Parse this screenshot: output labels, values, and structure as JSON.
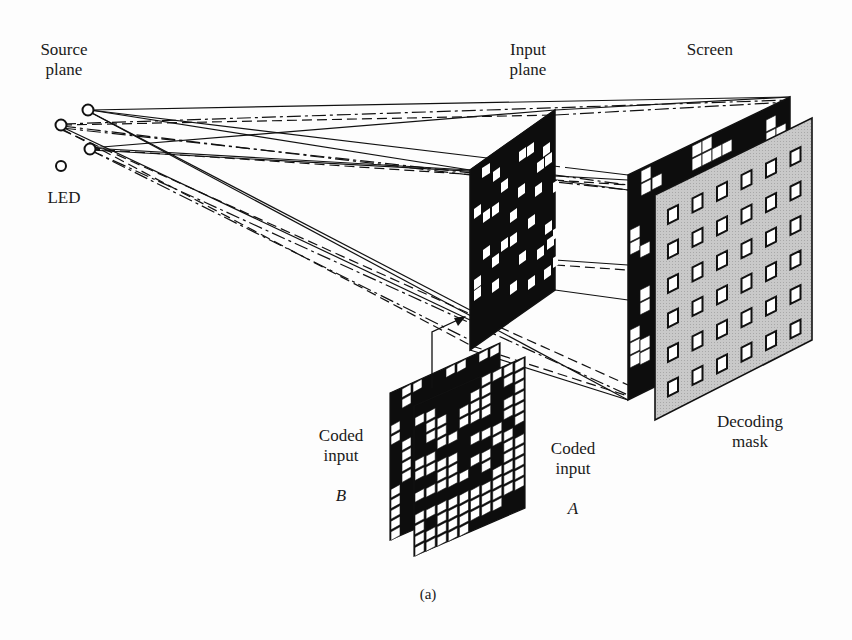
{
  "figure": {
    "caption": "(a)",
    "colors": {
      "ink": "#111111",
      "mask_fill": "#c4c4c4",
      "background": "#fdfdfd"
    }
  },
  "labels": {
    "source_plane": "Source\nplane",
    "led": "LED",
    "input_plane": "Input\nplane",
    "screen": "Screen",
    "decoding_mask": "Decoding\nmask",
    "coded_input_b": {
      "line1": "Coded\ninput",
      "letter": "B"
    },
    "coded_input_a": {
      "line1": "Coded\ninput",
      "letter": "A"
    }
  },
  "components": {
    "led_sources": [
      {
        "id": "led-1",
        "shape": "circle-icon"
      },
      {
        "id": "led-2",
        "shape": "circle-icon"
      },
      {
        "id": "led-3",
        "shape": "circle-icon"
      },
      {
        "id": "led-4",
        "shape": "circle-icon"
      }
    ],
    "decoding_mask_grid": {
      "rows": 6,
      "cols": 6
    },
    "ray_styles": [
      "solid",
      "dash-dot",
      "dashed"
    ]
  }
}
